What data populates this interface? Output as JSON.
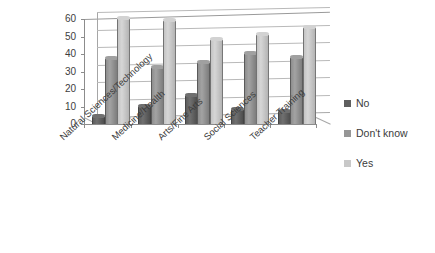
{
  "chart_data": {
    "type": "bar",
    "title": "",
    "subtitle": "",
    "xlabel": "",
    "ylabel": "",
    "ylim": [
      0,
      60
    ],
    "yticks": [
      0,
      10,
      20,
      30,
      40,
      50,
      60
    ],
    "grid": true,
    "legend_position": "right",
    "style": "3d-grouped-columns-grayscale",
    "categories": [
      "Natural Sciences/Technology",
      "Medicine/Health",
      "Arts/Fine Arts",
      "Social Sciences",
      "Teacher Training"
    ],
    "series": [
      {
        "name": "No",
        "color": "#5f5f5f",
        "values": [
          4,
          10,
          16,
          8,
          7
        ]
      },
      {
        "name": "Don't know",
        "color": "#969696",
        "values": [
          37,
          32,
          35,
          40,
          38
        ]
      },
      {
        "name": "Yes",
        "color": "#c8c8c8",
        "values": [
          60,
          59,
          48,
          51,
          55
        ]
      }
    ]
  },
  "legend": {
    "items": [
      {
        "label": "No",
        "swatch": "legend-swatch-no"
      },
      {
        "label": "Don't know",
        "swatch": "legend-swatch-dont-know"
      },
      {
        "label": "Yes",
        "swatch": "legend-swatch-yes"
      }
    ]
  },
  "axis": {
    "y_tick_labels": [
      "60",
      "50",
      "40",
      "30",
      "20",
      "10",
      "0"
    ]
  }
}
